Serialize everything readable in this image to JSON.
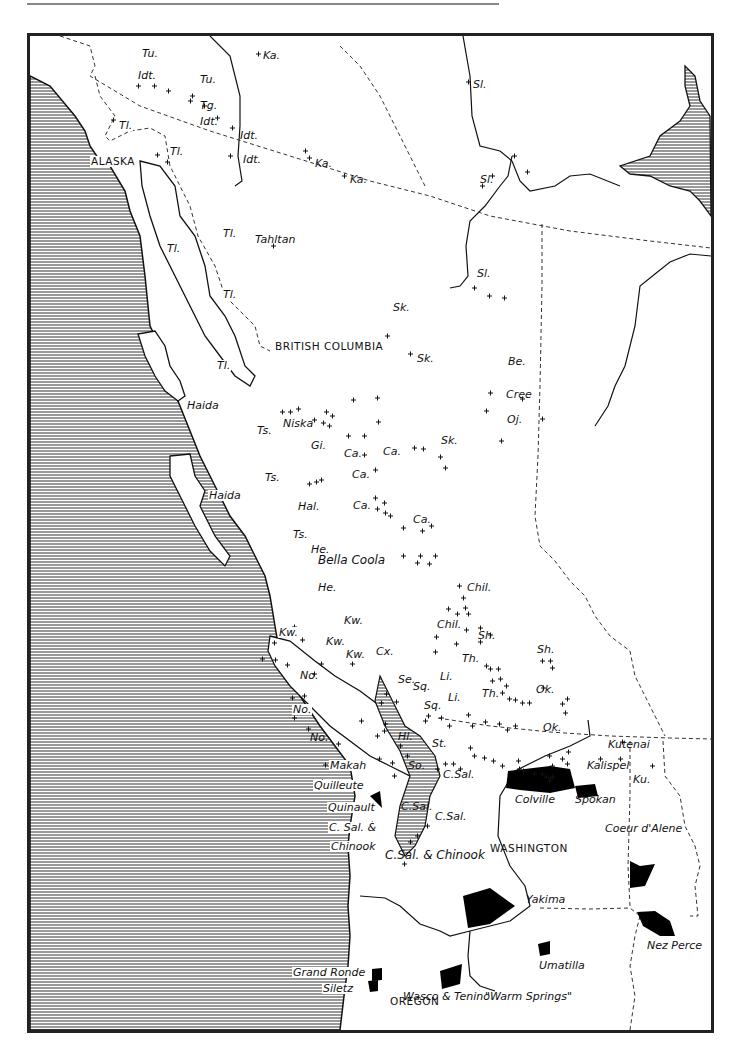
{
  "colors": {
    "ink": "#111111",
    "ocean_hatch": "#555555",
    "reservation_fill": "#000000",
    "paper": "#ffffff"
  },
  "regions": {
    "alaska": "ALASKA",
    "british_columbia": "BRITISH COLUMBIA",
    "washington": "WASHINGTON",
    "oregon": "OREGON"
  },
  "tribe_labels": {
    "tu_1": "Tu.",
    "idt_1": "Idt.",
    "tu_2": "Tu.",
    "ka_1": "Ka.",
    "tg": "Tg.",
    "idt_2": "Idt.",
    "idt_3": "Idt.",
    "idt_4": "Idt.",
    "tl_1": "Tl.",
    "tl_2": "Tl.",
    "ka_2": "Ka.",
    "ka_3": "Ka.",
    "sl_1": "Sl.",
    "sl_2": "Sl.",
    "sl_3": "Sl.",
    "tl_3": "Tl.",
    "tl_4": "Tl.",
    "tl_5": "Tl.",
    "tl_6": "Tl.",
    "tahltan": "Tahltan",
    "sk_1": "Sk.",
    "sk_2": "Sk.",
    "sk_3": "Sk.",
    "be": "Be.",
    "cree": "Cree",
    "oj": "Oj.",
    "haida_1": "Haida",
    "haida_2": "Haida",
    "ts_1": "Ts.",
    "ts_2": "Ts.",
    "ts_3": "Ts.",
    "niska": "Niska",
    "gi": "Gi.",
    "ca_1": "Ca.",
    "ca_2": "Ca.",
    "ca_3": "Ca.",
    "ca_4": "Ca.",
    "ca_5": "Ca.",
    "hal": "Hal.",
    "he_1": "He.",
    "he_2": "He.",
    "bella_coola": "Bella Coola",
    "chil_1": "Chil.",
    "chil_2": "Chil.",
    "kw_1": "Kw.",
    "kw_2": "Kw.",
    "kw_3": "Kw.",
    "kw_4": "Kw.",
    "cx": "Cx.",
    "sh_1": "Sh.",
    "sh_2": "Sh.",
    "th_1": "Th.",
    "th_2": "Th.",
    "se": "Se.",
    "sq_1": "Sq.",
    "sq_2": "Sq.",
    "li_1": "Li.",
    "li_2": "Li.",
    "ok_1": "Ok.",
    "ok_2": "Ok.",
    "no_1": "No.",
    "no_2": "No.",
    "no_3": "No.",
    "hl": "Hl.",
    "st": "St.",
    "so": "So.",
    "c_sal_1": "C.Sal.",
    "c_sal_2": "C.Sal.",
    "c_sal_3": "C.Sal.",
    "makah": "Makah",
    "quilleute": "Quilleute",
    "quinault": "Quinault",
    "c_sal_chinook_w1": "C. Sal. &",
    "c_sal_chinook_w2": "Chinook",
    "c_sal_chinook": "C.Sal.  & Chinook",
    "kutenai": "Kutenai",
    "kalispel": "Kalispel",
    "ku": "Ku.",
    "colville": "Colville",
    "spokan": "Spokan",
    "coeur_dalene": "Coeur d'Alene",
    "yakima": "Yakima",
    "nez_perce": "Nez Perce",
    "umatilla": "Umatilla",
    "grand_ronde": "Grand Ronde",
    "siletz": "Siletz",
    "wasco_tenino": "Wasco & Tenino",
    "warm_springs": "\"Warm Springs\""
  }
}
